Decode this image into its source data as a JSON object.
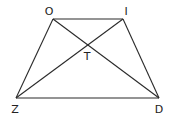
{
  "diagram": {
    "type": "geometry",
    "shape": "trapezoid",
    "stroke_color": "#2a2a2a",
    "points": {
      "O": {
        "x": 53,
        "y": 19,
        "label": "O",
        "lx": 49,
        "ly": 15
      },
      "I": {
        "x": 123,
        "y": 19,
        "label": "I",
        "lx": 126,
        "ly": 15
      },
      "Z": {
        "x": 16,
        "y": 98,
        "label": "Z",
        "lx": 15,
        "ly": 113
      },
      "D": {
        "x": 159,
        "y": 98,
        "label": "D",
        "lx": 159,
        "ly": 113
      },
      "T": {
        "x": 88,
        "y": 44,
        "label": "T",
        "lx": 87,
        "ly": 60
      }
    },
    "segments": [
      [
        "O",
        "I"
      ],
      [
        "I",
        "D"
      ],
      [
        "D",
        "Z"
      ],
      [
        "Z",
        "O"
      ],
      [
        "O",
        "D"
      ],
      [
        "Z",
        "I"
      ]
    ]
  }
}
